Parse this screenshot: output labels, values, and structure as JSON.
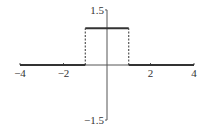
{
  "chart_data": {
    "type": "line",
    "title": "",
    "xlabel": "",
    "ylabel": "",
    "xlim": [
      -4,
      4
    ],
    "ylim": [
      -1.5,
      1.5
    ],
    "grid": false,
    "legend": null,
    "x_ticks": [
      -4,
      -2,
      2,
      4
    ],
    "x_tick_labels": [
      "−4",
      "−2",
      "2",
      "4"
    ],
    "y_ticks": [
      1.5,
      -1.5
    ],
    "y_tick_labels": [
      "1.5",
      "−1.5"
    ],
    "series": [
      {
        "name": "rectangular pulse",
        "style": "solid",
        "segments": [
          {
            "x": [
              -4,
              -1
            ],
            "y": [
              0,
              0
            ]
          },
          {
            "x": [
              -1,
              1
            ],
            "y": [
              1,
              1
            ]
          },
          {
            "x": [
              1,
              4
            ],
            "y": [
              0,
              0
            ]
          }
        ]
      },
      {
        "name": "discontinuity jumps",
        "style": "dashed",
        "segments": [
          {
            "x": [
              -1,
              -1
            ],
            "y": [
              0,
              1
            ]
          },
          {
            "x": [
              1,
              1
            ],
            "y": [
              0,
              1
            ]
          }
        ]
      }
    ],
    "colors": {
      "line": "#333333",
      "axis": "#555555"
    }
  }
}
